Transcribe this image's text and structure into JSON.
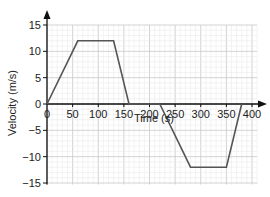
{
  "chart_data": {
    "type": "line",
    "title": "",
    "xlabel": "Time (s)",
    "ylabel": "Velocity (m/s)",
    "xlim": [
      0,
      400
    ],
    "ylim": [
      -15,
      15
    ],
    "x_ticks": [
      0,
      50,
      100,
      150,
      200,
      250,
      300,
      350,
      400
    ],
    "y_ticks": [
      15,
      10,
      5,
      0,
      -5,
      -10,
      -15
    ],
    "grid": true,
    "legend": null,
    "series": [
      {
        "name": "velocity",
        "x": [
          0,
          60,
          130,
          160,
          220,
          280,
          350,
          380
        ],
        "y": [
          0,
          12,
          12,
          0,
          0,
          -12,
          -12,
          0
        ]
      }
    ]
  },
  "colors": {
    "line": "#555555",
    "axis": "#111111",
    "grid_major": "#c8c8c8",
    "grid_minor": "#e6e6e6"
  }
}
